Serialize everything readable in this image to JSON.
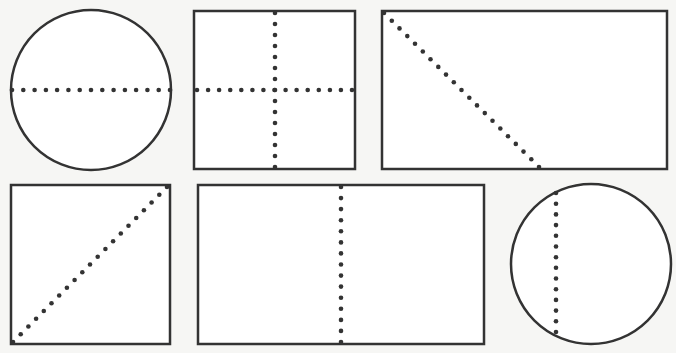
{
  "colors": {
    "background": "#f6f6f4",
    "shape_fill": "#ffffff",
    "stroke": "#333333",
    "dots": "#333333"
  },
  "shapes": [
    {
      "id": "circle-horizontal-diameter",
      "type": "circle",
      "cx": 91,
      "cy": 90,
      "r": 80,
      "divider": {
        "kind": "horizontal-diameter",
        "x1": 12,
        "y1": 90,
        "x2": 170,
        "y2": 90,
        "dots": 15
      }
    },
    {
      "id": "square-cross",
      "type": "rect",
      "x": 194,
      "y": 11,
      "w": 161,
      "h": 158,
      "dividers": [
        {
          "kind": "vertical-midline",
          "x1": 275,
          "y1": 13,
          "x2": 275,
          "y2": 167,
          "dots": 15
        },
        {
          "kind": "horizontal-midline",
          "x1": 197,
          "y1": 90,
          "x2": 352,
          "y2": 90,
          "dots": 15
        }
      ]
    },
    {
      "id": "rectangle-diagonal-cut",
      "type": "rect",
      "x": 382,
      "y": 11,
      "w": 285,
      "h": 158,
      "divider": {
        "kind": "diagonal",
        "x1": 384,
        "y1": 13,
        "x2": 539,
        "y2": 167,
        "dots": 21
      }
    },
    {
      "id": "square-diagonal",
      "type": "rect",
      "x": 11,
      "y": 185,
      "w": 159,
      "h": 159,
      "divider": {
        "kind": "diagonal",
        "x1": 13,
        "y1": 342,
        "x2": 167,
        "y2": 187,
        "dots": 21
      }
    },
    {
      "id": "rectangle-vertical-split",
      "type": "rect",
      "x": 198,
      "y": 185,
      "w": 286,
      "h": 159,
      "divider": {
        "kind": "vertical-line",
        "x1": 341,
        "y1": 187,
        "x2": 341,
        "y2": 342,
        "dots": 15
      }
    },
    {
      "id": "circle-vertical-chord",
      "type": "circle",
      "cx": 591,
      "cy": 264,
      "r": 80,
      "divider": {
        "kind": "vertical-chord",
        "x1": 556,
        "y1": 193,
        "x2": 556,
        "y2": 332,
        "dots": 14
      }
    }
  ]
}
